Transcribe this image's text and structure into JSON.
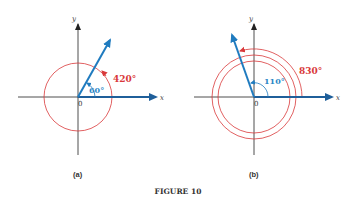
{
  "figure": {
    "caption": "FIGURE 10",
    "panels": [
      {
        "label": "(a)",
        "axes": {
          "x_label": "x",
          "y_label": "y",
          "origin_label": "0"
        },
        "reference_angle": "60°",
        "rotation_angle": "420°",
        "revolutions": 1
      },
      {
        "label": "(b)",
        "axes": {
          "x_label": "x",
          "y_label": "y",
          "origin_label": "0"
        },
        "reference_angle": "110°",
        "rotation_angle": "830°",
        "revolutions": 2
      }
    ]
  },
  "colors": {
    "ray": "#1f7bbf",
    "rotation_arc": "#d9393a",
    "reference_label": "#2a86c6",
    "axis": "#222222"
  }
}
